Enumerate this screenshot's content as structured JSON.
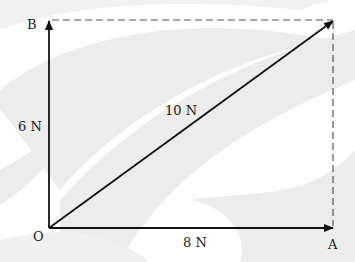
{
  "diagram": {
    "points": {
      "O": {
        "label": "O"
      },
      "A": {
        "label": "A"
      },
      "B": {
        "label": "B"
      }
    },
    "vectors": [
      {
        "from": "O",
        "to": "A",
        "magnitude_label": "8 N"
      },
      {
        "from": "O",
        "to": "B",
        "magnitude_label": "6 N"
      },
      {
        "from": "O",
        "to": "corner",
        "magnitude_label": "10 N",
        "role": "resultant"
      }
    ],
    "construction_lines": [
      "dashed from B to corner",
      "dashed from A to corner"
    ],
    "colors": {
      "line": "#111111",
      "dashed": "#555555",
      "background_swoosh": "#ececec"
    }
  }
}
